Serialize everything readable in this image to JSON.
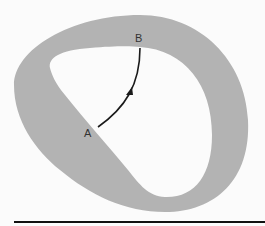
{
  "diagram": {
    "type": "topology-region",
    "points": [
      {
        "id": "A",
        "label": "A"
      },
      {
        "id": "B",
        "label": "B"
      }
    ],
    "path": {
      "from": "A",
      "to": "B",
      "arrow": "midpoint"
    },
    "colors": {
      "region_fill": "#b3b3b3",
      "background": "#fbfbfb",
      "path_stroke": "#1a1a1a",
      "baseline": "#111111"
    }
  }
}
